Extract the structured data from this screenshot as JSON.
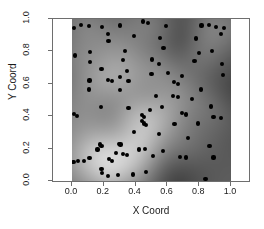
{
  "chart_data": {
    "type": "scatter",
    "title": "",
    "xlabel": "X Coord",
    "ylabel": "Y Coord",
    "xlim": [
      0.0,
      1.0
    ],
    "ylim": [
      0.0,
      1.0
    ],
    "xticks": [
      "0.0",
      "0.2",
      "0.4",
      "0.6",
      "0.8",
      "1.0"
    ],
    "xtick_values": [
      0.0,
      0.2,
      0.4,
      0.6,
      0.8,
      1.0
    ],
    "yticks": [
      "0.0",
      "0.2",
      "0.4",
      "0.6",
      "0.8",
      "1.0"
    ],
    "ytick_values": [
      0.0,
      0.2,
      0.4,
      0.6,
      0.8,
      1.0
    ],
    "grid": false,
    "legend": null,
    "background": "grayscale-density-raster",
    "point_color": "#000000",
    "point_count": 98,
    "points": [
      [
        0.015,
        0.945
      ],
      [
        0.055,
        0.965
      ],
      [
        0.105,
        0.955
      ],
      [
        0.19,
        0.95
      ],
      [
        0.3,
        0.96
      ],
      [
        0.445,
        0.985
      ],
      [
        0.48,
        0.975
      ],
      [
        0.59,
        0.955
      ],
      [
        0.815,
        0.96
      ],
      [
        0.86,
        0.965
      ],
      [
        0.905,
        0.95
      ],
      [
        0.955,
        0.945
      ],
      [
        0.225,
        0.905
      ],
      [
        0.23,
        0.865
      ],
      [
        0.39,
        0.895
      ],
      [
        0.555,
        0.885
      ],
      [
        0.78,
        0.88
      ],
      [
        0.935,
        0.905
      ],
      [
        0.02,
        0.775
      ],
      [
        0.115,
        0.795
      ],
      [
        0.335,
        0.8
      ],
      [
        0.575,
        0.82
      ],
      [
        0.8,
        0.79
      ],
      [
        0.88,
        0.8
      ],
      [
        0.115,
        0.735
      ],
      [
        0.32,
        0.745
      ],
      [
        0.505,
        0.75
      ],
      [
        0.545,
        0.72
      ],
      [
        0.77,
        0.74
      ],
      [
        0.945,
        0.72
      ],
      [
        0.185,
        0.69
      ],
      [
        0.345,
        0.68
      ],
      [
        0.5,
        0.66
      ],
      [
        0.605,
        0.665
      ],
      [
        0.69,
        0.65
      ],
      [
        0.95,
        0.655
      ],
      [
        0.11,
        0.62
      ],
      [
        0.225,
        0.625
      ],
      [
        0.25,
        0.615
      ],
      [
        0.3,
        0.64
      ],
      [
        0.355,
        0.615
      ],
      [
        0.64,
        0.61
      ],
      [
        0.665,
        0.6
      ],
      [
        0.105,
        0.565
      ],
      [
        0.3,
        0.56
      ],
      [
        0.81,
        0.565
      ],
      [
        0.53,
        0.525
      ],
      [
        0.635,
        0.525
      ],
      [
        0.665,
        0.52
      ],
      [
        0.755,
        0.505
      ],
      [
        0.18,
        0.455
      ],
      [
        0.355,
        0.45
      ],
      [
        0.49,
        0.44
      ],
      [
        0.565,
        0.455
      ],
      [
        0.875,
        0.46
      ],
      [
        0.015,
        0.415
      ],
      [
        0.03,
        0.4
      ],
      [
        0.44,
        0.405
      ],
      [
        0.455,
        0.395
      ],
      [
        0.69,
        0.42
      ],
      [
        0.715,
        0.41
      ],
      [
        0.89,
        0.395
      ],
      [
        0.935,
        0.39
      ],
      [
        0.44,
        0.37
      ],
      [
        0.455,
        0.355
      ],
      [
        0.465,
        0.345
      ],
      [
        0.645,
        0.35
      ],
      [
        0.79,
        0.355
      ],
      [
        0.39,
        0.3
      ],
      [
        0.545,
        0.29
      ],
      [
        0.73,
        0.265
      ],
      [
        0.175,
        0.225
      ],
      [
        0.185,
        0.215
      ],
      [
        0.295,
        0.23
      ],
      [
        0.305,
        0.225
      ],
      [
        0.865,
        0.215
      ],
      [
        0.16,
        0.195
      ],
      [
        0.42,
        0.195
      ],
      [
        0.46,
        0.2
      ],
      [
        0.57,
        0.185
      ],
      [
        0.275,
        0.175
      ],
      [
        0.32,
        0.165
      ],
      [
        0.345,
        0.16
      ],
      [
        0.51,
        0.155
      ],
      [
        0.68,
        0.15
      ],
      [
        0.715,
        0.145
      ],
      [
        0.89,
        0.145
      ],
      [
        0.01,
        0.115
      ],
      [
        0.04,
        0.125
      ],
      [
        0.075,
        0.125
      ],
      [
        0.11,
        0.14
      ],
      [
        0.235,
        0.135
      ],
      [
        0.25,
        0.125
      ],
      [
        0.185,
        0.075
      ],
      [
        0.19,
        0.05
      ],
      [
        0.29,
        0.035
      ],
      [
        0.385,
        0.04
      ],
      [
        0.465,
        0.055
      ],
      [
        0.225,
        0.03
      ],
      [
        0.84,
        0.01
      ]
    ]
  },
  "axes": {
    "x_title": "X Coord",
    "y_title": "Y Coord",
    "x_tick_labels": [
      "0.0",
      "0.2",
      "0.4",
      "0.6",
      "0.8",
      "1.0"
    ],
    "y_tick_labels": [
      "0.0",
      "0.2",
      "0.4",
      "0.6",
      "0.8",
      "1.0"
    ]
  },
  "colors": {
    "point": "#000000",
    "frame": "#6e6e6e",
    "text": "#1a1a1a",
    "background": "#ffffff",
    "density_light": "#d8d8d8",
    "density_dark": "#4a4a4a"
  }
}
